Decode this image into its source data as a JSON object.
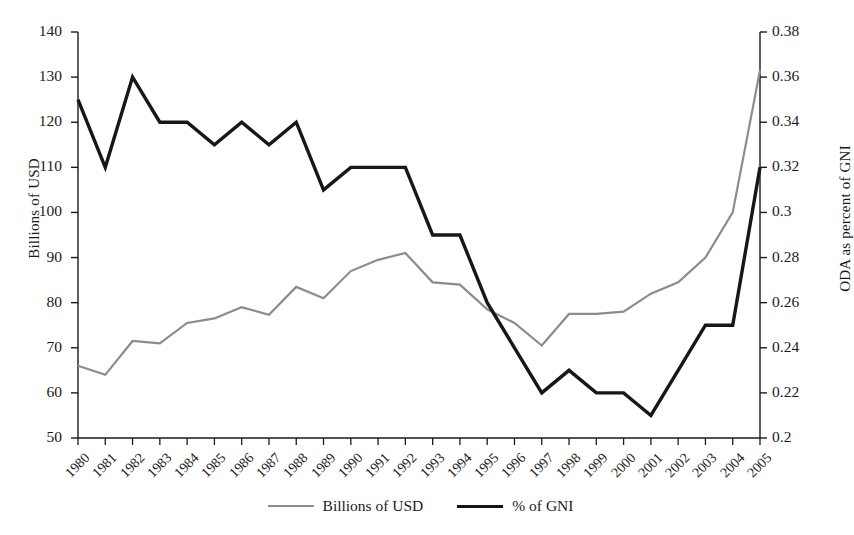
{
  "chart_data": {
    "type": "line",
    "title": "",
    "xlabel": "",
    "ylabel": "Billions of USD",
    "y2label": "ODA as percent of GNI",
    "grid": false,
    "legend_position": "bottom-center",
    "categories": [
      "1980",
      "1981",
      "1982",
      "1983",
      "1984",
      "1985",
      "1986",
      "1987",
      "1988",
      "1989",
      "1990",
      "1991",
      "1992",
      "1993",
      "1994",
      "1995",
      "1996",
      "1997",
      "1998",
      "1999",
      "2000",
      "2001",
      "2002",
      "2003",
      "2004",
      "2005"
    ],
    "ylim": [
      50,
      140
    ],
    "yticks": [
      "50",
      "60",
      "70",
      "80",
      "90",
      "100",
      "110",
      "120",
      "130",
      "140"
    ],
    "y2lim": [
      0.2,
      0.38
    ],
    "y2ticks": [
      "0.2",
      "0.22",
      "0.24",
      "0.26",
      "0.28",
      "0.3",
      "0.32",
      "0.34",
      "0.36",
      "0.38"
    ],
    "series": [
      {
        "name": "Billions of USD",
        "axis": "left",
        "color": "#8c8c8c",
        "width": 2.2,
        "values": [
          66,
          64,
          71.5,
          71,
          75.5,
          76.5,
          79,
          77.3,
          83.5,
          81,
          87,
          89.5,
          91,
          84.5,
          84,
          78.5,
          75.5,
          70.5,
          77.5,
          77.5,
          78,
          82,
          84.5,
          90,
          100,
          131.5
        ]
      },
      {
        "name": "% of GNI",
        "axis": "right",
        "color": "#171717",
        "width": 3.4,
        "values": [
          0.35,
          0.32,
          0.36,
          0.34,
          0.34,
          0.33,
          0.34,
          0.33,
          0.34,
          0.31,
          0.32,
          0.32,
          0.32,
          0.29,
          0.29,
          0.26,
          0.24,
          0.22,
          0.23,
          0.22,
          0.22,
          0.21,
          0.23,
          0.25,
          0.25,
          0.32
        ]
      }
    ]
  },
  "legend": {
    "entries": [
      {
        "label": "Billions of USD",
        "marker": "line-gray"
      },
      {
        "label": "% of GNI",
        "marker": "line-black"
      }
    ]
  }
}
